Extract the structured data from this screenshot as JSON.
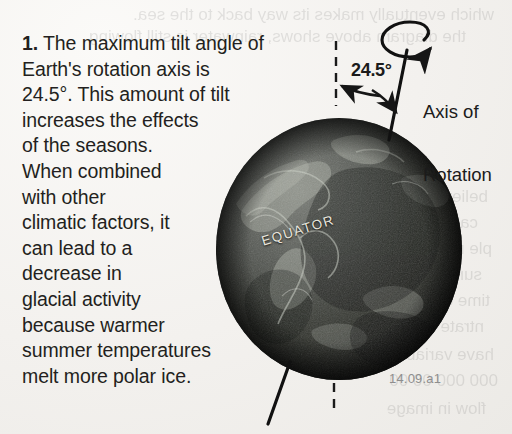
{
  "figure": {
    "id_label": "14.09.a1",
    "kind": "textbook-scanned-diagram"
  },
  "question": {
    "number": "1.",
    "lines": [
      "The maximum tilt angle of",
      "Earth's rotation axis is",
      "24.5°. This amount of tilt",
      "increases the effects",
      "of the seasons.",
      "When combined",
      "with other",
      "climatic factors, it",
      "can lead to a",
      "decrease in",
      "glacial activity",
      "because warmer",
      "summer temperatures",
      "melt more polar ice."
    ],
    "full_text": "1. The maximum tilt angle of Earth's rotation axis is 24.5°. This amount of tilt increases the effects of the seasons. When combined with other climatic factors, it can lead to a decrease in glacial activity because warmer summer temperatures melt more polar ice."
  },
  "diagram": {
    "angle_label": "24.5°",
    "axis_label_line1": "Axis of",
    "axis_label_line2": "Rotation",
    "equator_label": "EQUATOR",
    "reference_line_style": "dashed-vertical",
    "axis_line_style": "solid-tilted",
    "rotation_indicator": "curved-arrow-ellipse",
    "tilt_degrees": 24.5
  },
  "ghost_text": {
    "note": "faint mirrored show-through from reverse page",
    "lines": [
      "which eventually makes its way back to the sea.",
      "the diagram above shows, rainwater is still flowing",
      "believed to be",
      "can form",
      "ple may",
      "surface",
      "time of",
      "ntrate",
      "have variable",
      "000 000 00 00",
      "flow in image"
    ]
  },
  "colors": {
    "paper": "#f3f1ee",
    "ink": "#231f20",
    "globe_dark": "#2b2d2c",
    "globe_light": "#8d9089",
    "equator_text": "#e9e6dd",
    "figure_id": "#8e8e8e",
    "annotation": "#1b1b1b"
  }
}
